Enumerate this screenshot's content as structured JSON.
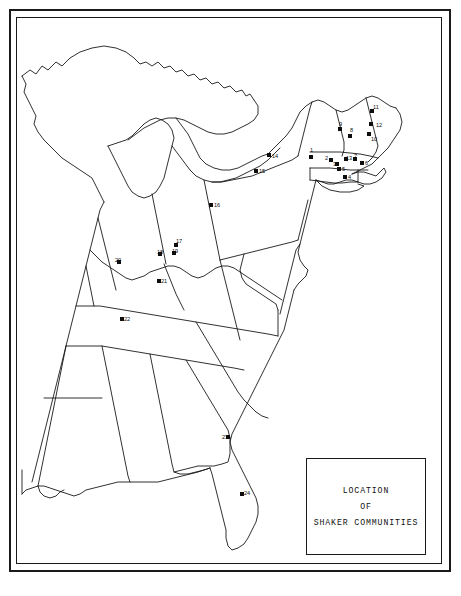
{
  "legend": {
    "line1": "LOCATION",
    "line2": "OF",
    "line3": "SHAKER  COMMUNITIES"
  },
  "colors": {
    "ink": "#1a1a1a",
    "marker": "#0d0d0d",
    "paper": "#ffffff"
  },
  "map_data": {
    "type": "point-map",
    "region": "Eastern United States",
    "marker_count": 24,
    "markers": [
      {
        "id": "1",
        "label": "1",
        "x": 311,
        "y": 157,
        "lx": 310,
        "ly": 148
      },
      {
        "id": "2",
        "label": "2",
        "x": 331,
        "y": 160,
        "lx": 325,
        "ly": 156
      },
      {
        "id": "3",
        "label": "3",
        "x": 337,
        "y": 164,
        "lx": 333,
        "ly": 162
      },
      {
        "id": "4",
        "label": "4",
        "x": 345,
        "y": 177,
        "lx": 348,
        "ly": 175
      },
      {
        "id": "5",
        "label": "5",
        "x": 339,
        "y": 169,
        "lx": 342,
        "ly": 167
      },
      {
        "id": "6",
        "label": "6",
        "x": 362,
        "y": 163,
        "lx": 365,
        "ly": 161
      },
      {
        "id": "7",
        "label": "7",
        "x": 355,
        "y": 159,
        "lx": 354,
        "ly": 154
      },
      {
        "id": "8",
        "label": "8",
        "x": 350,
        "y": 136,
        "lx": 350,
        "ly": 128
      },
      {
        "id": "9",
        "label": "9",
        "x": 340,
        "y": 129,
        "lx": 339,
        "ly": 122
      },
      {
        "id": "10",
        "label": "10",
        "x": 369,
        "y": 134,
        "lx": 371,
        "ly": 137
      },
      {
        "id": "11",
        "label": "11",
        "x": 372,
        "y": 111,
        "lx": 373,
        "ly": 105
      },
      {
        "id": "12",
        "label": "12",
        "x": 371,
        "y": 124,
        "lx": 376,
        "ly": 123
      },
      {
        "id": "13",
        "label": "13",
        "x": 346,
        "y": 159,
        "lx": 346,
        "ly": 156
      },
      {
        "id": "14",
        "label": "14",
        "x": 269,
        "y": 155,
        "lx": 272,
        "ly": 154
      },
      {
        "id": "15",
        "label": "15",
        "x": 256,
        "y": 171,
        "lx": 259,
        "ly": 169
      },
      {
        "id": "16",
        "label": "16",
        "x": 211,
        "y": 205,
        "lx": 214,
        "ly": 203
      },
      {
        "id": "17",
        "label": "17",
        "x": 176,
        "y": 245,
        "lx": 176,
        "ly": 239
      },
      {
        "id": "18",
        "label": "18",
        "x": 160,
        "y": 254,
        "lx": 157,
        "ly": 250
      },
      {
        "id": "19",
        "label": "19",
        "x": 174,
        "y": 253,
        "lx": 172,
        "ly": 249
      },
      {
        "id": "20",
        "label": "20",
        "x": 119,
        "y": 262,
        "lx": 115,
        "ly": 258
      },
      {
        "id": "21",
        "label": "21",
        "x": 159,
        "y": 281,
        "lx": 161,
        "ly": 279
      },
      {
        "id": "22",
        "label": "22",
        "x": 122,
        "y": 319,
        "lx": 124,
        "ly": 317
      },
      {
        "id": "23",
        "label": "23",
        "x": 228,
        "y": 437,
        "lx": 222,
        "ly": 435
      },
      {
        "id": "24",
        "label": "24",
        "x": 242,
        "y": 494,
        "lx": 244,
        "ly": 491
      }
    ]
  }
}
